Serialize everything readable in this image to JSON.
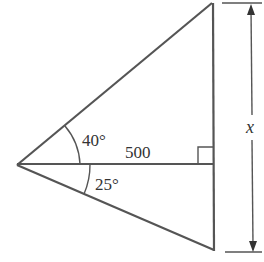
{
  "diagram": {
    "type": "geometry-triangle",
    "labels": {
      "upper_angle": "40°",
      "lower_angle": "25°",
      "base_length": "500",
      "height_variable": "x"
    },
    "colors": {
      "line": "#555555",
      "text": "#333333",
      "background": "#ffffff"
    },
    "right_angle_marker": true
  }
}
